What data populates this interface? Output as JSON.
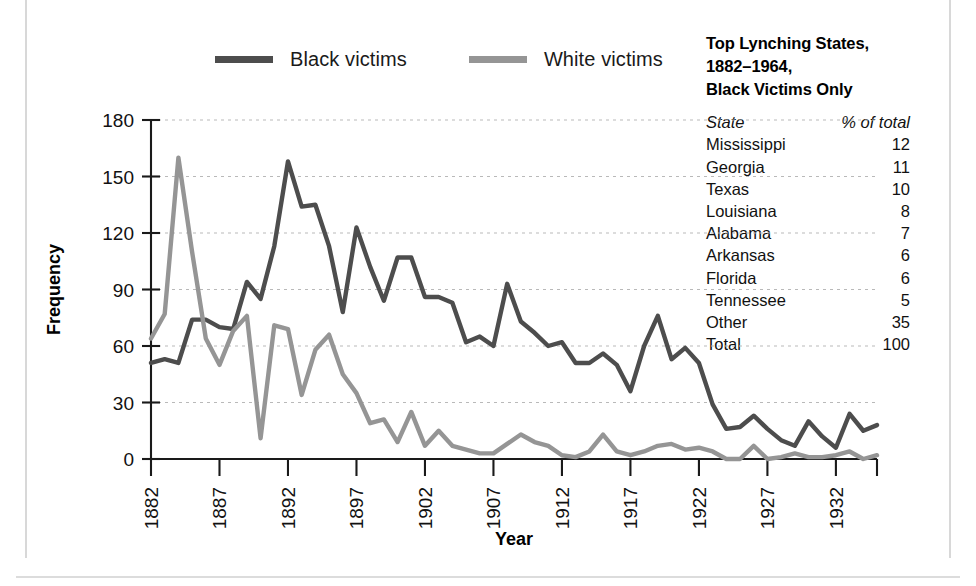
{
  "legend": {
    "items": [
      {
        "label": "Black victims",
        "color": "#4d4d4d",
        "key": "black"
      },
      {
        "label": "White victims",
        "color": "#959595",
        "key": "white"
      }
    ]
  },
  "side_panel": {
    "title_lines": [
      "Top Lynching States,",
      "1882–1964,",
      "Black Victims Only"
    ],
    "columns": [
      "State",
      "% of total"
    ],
    "rows": [
      {
        "state": "Mississippi",
        "pct": "12"
      },
      {
        "state": "Georgia",
        "pct": "11"
      },
      {
        "state": "Texas",
        "pct": "10"
      },
      {
        "state": "Louisiana",
        "pct": "8"
      },
      {
        "state": "Alabama",
        "pct": "7"
      },
      {
        "state": "Arkansas",
        "pct": "6"
      },
      {
        "state": "Florida",
        "pct": "6"
      },
      {
        "state": "Tennessee",
        "pct": "5"
      },
      {
        "state": "Other",
        "pct": "35"
      },
      {
        "state": "Total",
        "pct": "100"
      }
    ]
  },
  "chart_data": {
    "type": "line",
    "title": "",
    "xlabel": "Year",
    "ylabel": "Frequency",
    "xlim": [
      1882,
      1935
    ],
    "ylim": [
      0,
      180
    ],
    "yticks": [
      0,
      30,
      60,
      90,
      120,
      150,
      180
    ],
    "xticks": [
      1882,
      1887,
      1892,
      1897,
      1902,
      1907,
      1912,
      1917,
      1922,
      1927,
      1932
    ],
    "grid": true,
    "legend_position": "top",
    "x": [
      1882,
      1883,
      1884,
      1885,
      1886,
      1887,
      1888,
      1889,
      1890,
      1891,
      1892,
      1893,
      1894,
      1895,
      1896,
      1897,
      1898,
      1899,
      1900,
      1901,
      1902,
      1903,
      1904,
      1905,
      1906,
      1907,
      1908,
      1909,
      1910,
      1911,
      1912,
      1913,
      1914,
      1915,
      1916,
      1917,
      1918,
      1919,
      1920,
      1921,
      1922,
      1923,
      1924,
      1925,
      1926,
      1927,
      1928,
      1929,
      1930,
      1931,
      1932,
      1933,
      1934,
      1935
    ],
    "series": [
      {
        "name": "Black victims",
        "color": "#4d4d4d",
        "values": [
          51,
          53,
          51,
          74,
          74,
          70,
          69,
          94,
          85,
          113,
          158,
          134,
          135,
          113,
          78,
          123,
          102,
          84,
          107,
          107,
          86,
          86,
          83,
          62,
          65,
          60,
          93,
          73,
          67,
          60,
          62,
          51,
          51,
          56,
          50,
          36,
          60,
          76,
          53,
          59,
          51,
          29,
          16,
          17,
          23,
          16,
          10,
          7,
          20,
          12,
          6,
          24,
          15,
          18
        ]
      },
      {
        "name": "White victims",
        "color": "#959595",
        "values": [
          64,
          77,
          160,
          110,
          64,
          50,
          68,
          76,
          11,
          71,
          69,
          34,
          58,
          66,
          45,
          35,
          19,
          21,
          9,
          25,
          7,
          15,
          7,
          5,
          3,
          3,
          8,
          13,
          9,
          7,
          2,
          1,
          4,
          13,
          4,
          2,
          4,
          7,
          8,
          5,
          6,
          4,
          0,
          0,
          7,
          0,
          1,
          3,
          1,
          1,
          2,
          4,
          0,
          2
        ]
      }
    ]
  }
}
